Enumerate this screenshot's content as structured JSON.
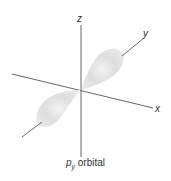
{
  "diagram": {
    "axes": {
      "z_label": "z",
      "y_label": "y",
      "x_label": "x"
    },
    "caption": {
      "main": "p",
      "subscript": "y",
      "suffix": " orbital"
    },
    "colors": {
      "lobe": "#d9d9d9",
      "axis": "#555555",
      "text": "#333333"
    }
  }
}
